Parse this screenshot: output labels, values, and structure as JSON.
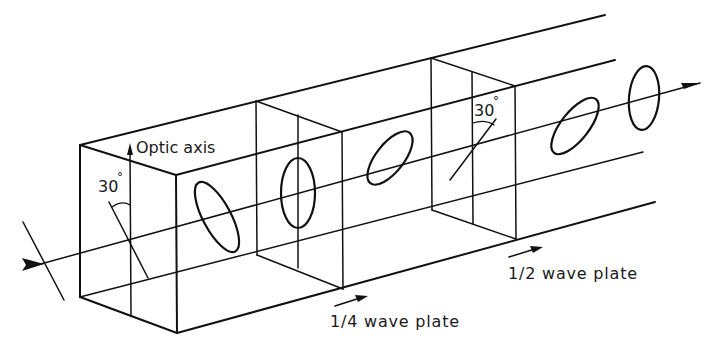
{
  "diagram": {
    "type": "optics-schematic",
    "labels": {
      "optic_axis": "Optic axis",
      "angle_input": "30",
      "angle_half": "30",
      "degree_mark": "°",
      "quarter_wave_plate": "1/4 wave plate",
      "half_wave_plate": "1/2 wave plate"
    },
    "elements": [
      {
        "id": "input-polarization",
        "kind": "linear polarization line",
        "angle_deg": 30
      },
      {
        "id": "quarter-wave-plate",
        "label": "1/4 wave plate",
        "optic_axis_angle_deg": 30
      },
      {
        "id": "ellipse-1",
        "kind": "elliptical polarization",
        "orientation": "tilted"
      },
      {
        "id": "ellipse-2",
        "kind": "elliptical polarization",
        "orientation": "vertical"
      },
      {
        "id": "ellipse-3",
        "kind": "elliptical polarization",
        "orientation": "tilted"
      },
      {
        "id": "half-wave-plate",
        "label": "1/2 wave plate",
        "angle_deg": 30
      },
      {
        "id": "ellipse-4",
        "kind": "elliptical polarization",
        "orientation": "tilted"
      },
      {
        "id": "ellipse-5",
        "kind": "elliptical polarization",
        "orientation": "vertical"
      }
    ],
    "colors": {
      "ink": "#111111",
      "background": "#ffffff"
    }
  }
}
